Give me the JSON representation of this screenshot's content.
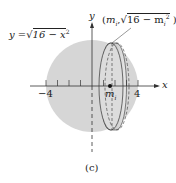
{
  "figure": {
    "caption": "(c)",
    "curve_label": "y = √16 − x²",
    "curve_label_parts": {
      "lhs": "y",
      "eq": "=",
      "rad": "√",
      "radicand": "16 − x",
      "exp": "2"
    },
    "point_label": "(mᵢ, √16 − mᵢ²)",
    "point_label_parts": {
      "open": "(",
      "m": "m",
      "sub": "i",
      "comma": ",",
      "rad": "√",
      "radicand": "16 − m",
      "sub2": "i",
      "exp": "2",
      "close": ")"
    },
    "x_axis_label": "x",
    "y_axis_label": "y",
    "tick_labels": {
      "neg": "−4",
      "pos": "4",
      "mi": "m",
      "mi_sub": "i"
    },
    "colors": {
      "sphere_fill": "#d4d4d4",
      "disc_dark": "#9a9a9a",
      "disc_light": "#e6e6e6",
      "axis": "#333333"
    }
  }
}
